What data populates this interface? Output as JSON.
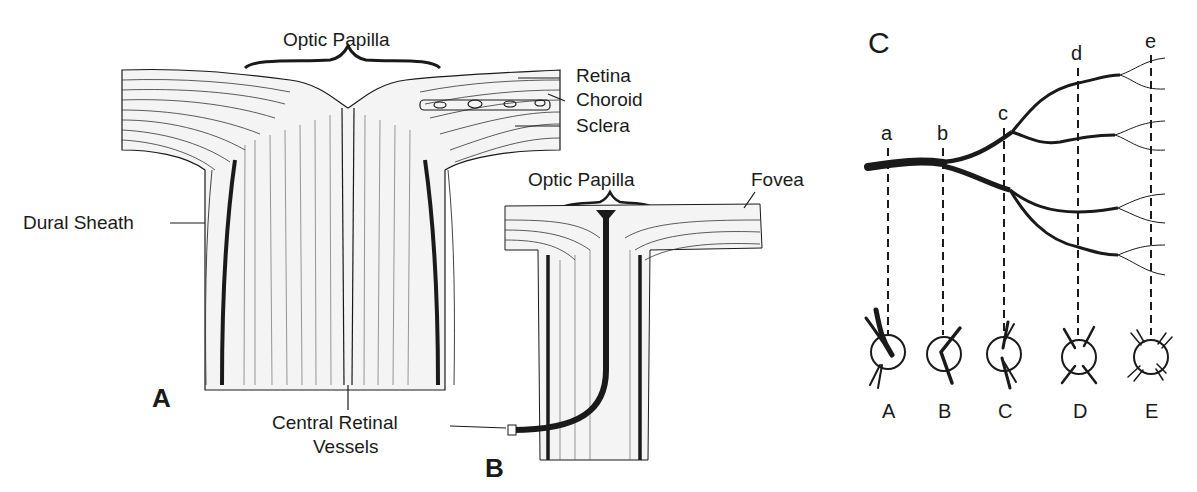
{
  "figure": {
    "panel_a": {
      "letter": "A",
      "labels": {
        "optic_papilla": "Optic Papilla",
        "retina": "Retina",
        "choroid": "Choroid",
        "sclera": "Sclera",
        "dural_sheath": "Dural Sheath",
        "central_retinal_vessels_line1": "Central Retinal",
        "central_retinal_vessels_line2": "Vessels"
      }
    },
    "panel_b": {
      "letter": "B",
      "labels": {
        "optic_papilla": "Optic Papilla",
        "fovea": "Fovea"
      }
    },
    "panel_c": {
      "letter": "C",
      "section_markers": [
        "a",
        "b",
        "c",
        "d",
        "e"
      ],
      "cross_section_labels": [
        "A",
        "B",
        "C",
        "D",
        "E"
      ]
    },
    "colors": {
      "ink": "#1a1a1a",
      "background": "#ffffff"
    }
  }
}
